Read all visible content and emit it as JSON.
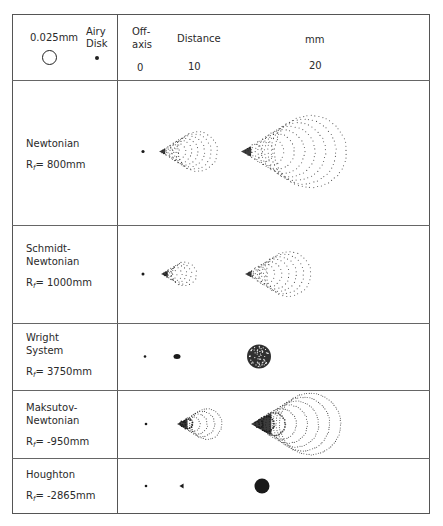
{
  "header": {
    "scale_label": "0.025mm",
    "airy_label_line1": "Airy",
    "airy_label_line2": "Disk",
    "offaxis_line1": "Off-",
    "offaxis_line2": "axis",
    "distance_label": "Distance",
    "unit_label": "mm",
    "ticks": [
      "0",
      "10",
      "20"
    ]
  },
  "rows": [
    {
      "name": "Newtonian",
      "rf_prefix": "R",
      "rf_sub": "f",
      "rf_value": "= 800mm",
      "top": 80,
      "bottom": 225,
      "label_top": 137,
      "spots": [
        {
          "type": "dot",
          "x": 143,
          "r": 1.6
        },
        {
          "type": "coma",
          "x": 160,
          "scale": 0.55,
          "rings": 9
        },
        {
          "type": "coma",
          "x": 242,
          "scale": 1.0,
          "rings": 10
        }
      ]
    },
    {
      "name": "Schmidt-\nNewtonian",
      "rf_prefix": "R",
      "rf_sub": "f",
      "rf_value": "= 1000mm",
      "top": 225,
      "bottom": 323,
      "label_top": 242,
      "spots": [
        {
          "type": "dot",
          "x": 143,
          "r": 1.5
        },
        {
          "type": "coma",
          "x": 162,
          "scale": 0.33,
          "rings": 7,
          "dense": true
        },
        {
          "type": "coma",
          "x": 246,
          "scale": 0.62,
          "rings": 9
        }
      ]
    },
    {
      "name": "Wright\nSystem",
      "rf_prefix": "R",
      "rf_sub": "f",
      "rf_value": "= 3750mm",
      "top": 323,
      "bottom": 390,
      "label_top": 331,
      "spots": [
        {
          "type": "dot",
          "x": 145,
          "r": 1.3
        },
        {
          "type": "blob",
          "x": 177,
          "rx": 3.5,
          "ry": 2.5
        },
        {
          "type": "speckle",
          "x": 259,
          "r": 12
        }
      ]
    },
    {
      "name": "Maksutov-\nNewtonian",
      "rf_prefix": "R",
      "rf_sub": "f",
      "rf_value": "= -950mm",
      "top": 390,
      "bottom": 458,
      "label_top": 401,
      "spots": [
        {
          "type": "dot",
          "x": 146,
          "r": 1.3
        },
        {
          "type": "tightcoma",
          "x": 178,
          "scale": 0.42,
          "rings": 6
        },
        {
          "type": "tightcoma",
          "x": 252,
          "scale": 0.85,
          "rings": 8
        }
      ]
    },
    {
      "name": "Houghton",
      "rf_prefix": "R",
      "rf_sub": "f",
      "rf_value": "= -2865mm",
      "top": 458,
      "bottom": 514,
      "label_top": 468,
      "spots": [
        {
          "type": "dot",
          "x": 146,
          "r": 1.3
        },
        {
          "type": "tri",
          "x": 182,
          "r": 2.6
        },
        {
          "type": "solid",
          "x": 262,
          "r": 7.5
        }
      ]
    }
  ],
  "colors": {
    "ink": "#1a1a1a",
    "border": "#555555"
  }
}
